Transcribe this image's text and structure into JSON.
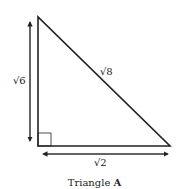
{
  "diagram": {
    "caption_prefix": "Triangle ",
    "caption_name": "A",
    "labels": {
      "left_side": "√6",
      "hypotenuse": "√8",
      "bottom_side": "√2"
    },
    "right_angle_marker": true
  }
}
